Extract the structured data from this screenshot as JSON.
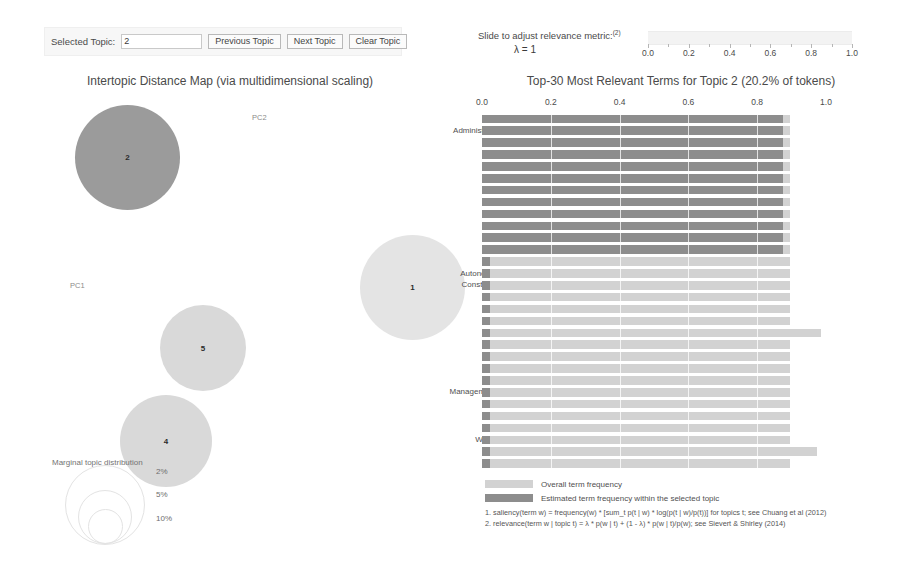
{
  "topic_control": {
    "label": "Selected Topic:",
    "selected_topic_value": "2",
    "previous_button": "Previous Topic",
    "next_button": "Next Topic",
    "clear_button": "Clear Topic"
  },
  "lambda_control": {
    "label": "Slide to adjust relevance metric:",
    "label_superscript": "(2)",
    "lambda_display": "λ = 1",
    "lambda_value": 1.0,
    "slider_ticks": [
      "0.0",
      "0.2",
      "0.4",
      "0.6",
      "0.8",
      "1.0"
    ]
  },
  "left_panel": {
    "title": "Intertopic Distance Map (via multidimensional scaling)",
    "axis_labels": {
      "x": "PC1",
      "y": "PC2"
    },
    "marginal_legend_label": "Marginal topic distribution",
    "marginal_sizes": [
      "2%",
      "5%",
      "10%"
    ],
    "topics": [
      {
        "id": "2",
        "label": "2",
        "selected": true,
        "x": 55,
        "y": 10,
        "d": 105
      },
      {
        "id": "5",
        "label": "5",
        "selected": false,
        "x": 140,
        "y": 210,
        "d": 86
      },
      {
        "id": "4",
        "label": "4",
        "selected": false,
        "x": 100,
        "y": 300,
        "d": 92
      },
      {
        "id": "1",
        "label": "1",
        "selected": false,
        "x": 340,
        "y": 140,
        "d": 105
      }
    ]
  },
  "right_panel": {
    "title": "Top-30 Most Relevant Terms for Topic 2 (20.2% of tokens)",
    "legend": {
      "overall": "Overall term frequency",
      "estimated": "Estimated term frequency within the selected topic"
    },
    "footnotes": [
      "1. saliency(term w) = frequency(w) * [sum_t p(t | w) * log(p(t | w)/p(t))] for topics t; see Chuang et al (2012)",
      "2. relevance(term w | topic t) = λ * p(w | t) + (1 - λ) * p(w | t)/p(w); see Sievert & Shirley (2014)"
    ]
  },
  "chart_data": {
    "type": "bar",
    "title": "Top-30 Most Relevant Terms for Topic 2 (20.2% of tokens)",
    "xlabel": "",
    "ylabel": "",
    "xlim": [
      0.0,
      1.0
    ],
    "xticks": [
      0.0,
      0.2,
      0.4,
      0.6,
      0.8,
      1.0
    ],
    "grid": false,
    "legend_position": "bottom",
    "orientation": "horizontal",
    "categories": [
      "Lawfully",
      "Administration-License",
      "Fine",
      "Hearing",
      "Hydrological",
      "Implement",
      "Department",
      "Organization",
      "Organs",
      "Provisions",
      "Riverway",
      "Construction",
      "Authorities",
      "Autonomous-regions",
      "Construction-Project",
      "County",
      "Data",
      "decision",
      "Fetchwater",
      "Enacted",
      "Flood-control",
      "Flood-defense",
      "location",
      "Managementinstitutions",
      "Quality",
      "Requirements",
      "Reservoir",
      "Water-resources",
      "Administration",
      "Application"
    ],
    "series": [
      {
        "name": "Overall term frequency",
        "color": "#d2d2d2",
        "values": [
          0.895,
          0.895,
          0.895,
          0.895,
          0.895,
          0.895,
          0.895,
          0.895,
          0.895,
          0.895,
          0.895,
          0.895,
          0.895,
          0.895,
          0.895,
          0.895,
          0.895,
          0.895,
          0.985,
          0.895,
          0.895,
          0.895,
          0.895,
          0.895,
          0.895,
          0.895,
          0.895,
          0.895,
          0.975,
          0.895
        ]
      },
      {
        "name": "Estimated term frequency within the selected topic",
        "color": "#8d8d8d",
        "values": [
          0.875,
          0.875,
          0.875,
          0.875,
          0.875,
          0.875,
          0.875,
          0.875,
          0.875,
          0.875,
          0.875,
          0.875,
          0.022,
          0.022,
          0.022,
          0.022,
          0.022,
          0.022,
          0.022,
          0.022,
          0.022,
          0.022,
          0.022,
          0.022,
          0.022,
          0.022,
          0.022,
          0.022,
          0.022,
          0.022
        ]
      }
    ]
  }
}
